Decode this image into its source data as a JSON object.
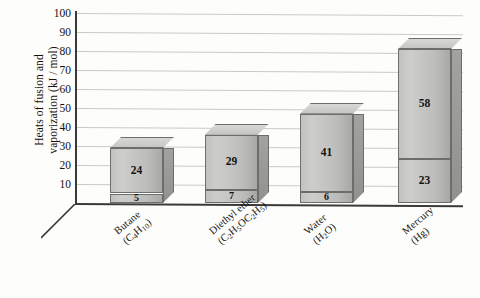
{
  "chart": {
    "type": "bar",
    "title": "",
    "xlabel": "",
    "ylabel_line1": "Heats of fusion and",
    "ylabel_line2": "vaporization (kJ / mol)",
    "ylim": [
      0,
      100
    ],
    "yticks": [
      10,
      20,
      30,
      40,
      50,
      60,
      70,
      80,
      90,
      100
    ],
    "grid": true,
    "legend": "none",
    "style": "3d-stacked-column",
    "axis_color": "#3c3a38",
    "grid_color": "#c9c9c7",
    "bar_face_color": "#c2c2c0",
    "bar_top_color": "#d8d8d6",
    "bar_side_color": "#a2a2a0",
    "background": "#fdfdfc"
  },
  "chart_data": {
    "type": "bar",
    "title": "",
    "xlabel": "",
    "ylabel": "Heats of fusion and vaporization (kJ / mol)",
    "ylim": [
      0,
      100
    ],
    "yticks": [
      10,
      20,
      30,
      40,
      50,
      60,
      70,
      80,
      90,
      100
    ],
    "grid": true,
    "legend": "none",
    "stacked": true,
    "categories": [
      "Butane (C4H10)",
      "Diethyl ether (C2H5OC2H5)",
      "Water (H2O)",
      "Mercury (Hg)"
    ],
    "series": [
      {
        "name": "Heat of fusion",
        "values": [
          5,
          7,
          6,
          23
        ]
      },
      {
        "name": "Heat of vaporization",
        "values": [
          24,
          29,
          41,
          58
        ]
      }
    ],
    "totals": [
      29,
      36,
      47,
      81
    ]
  },
  "categories": [
    {
      "name": "butane",
      "line1": "Butane",
      "line2_pre": "(C",
      "line2_sub1": "4",
      "line2_mid1": "H",
      "line2_sub2": "10",
      "line2_post": ")",
      "fusion": 5,
      "vaporization": 24
    },
    {
      "name": "diethyl-ether",
      "line1": "Diethyl ether",
      "line2_pre": "(C",
      "line2_sub1": "2",
      "line2_mid1": "H",
      "line2_sub2": "5",
      "line2_mid2": "OC",
      "line2_sub3": "2",
      "line2_mid3": "H",
      "line2_sub4": "5",
      "line2_post": ")",
      "fusion": 7,
      "vaporization": 29
    },
    {
      "name": "water",
      "line1": "Water",
      "line2_pre": "(H",
      "line2_sub1": "2",
      "line2_mid1": "O",
      "line2_post": ")",
      "fusion": 6,
      "vaporization": 41
    },
    {
      "name": "mercury",
      "line1": "Mercury",
      "line2_pre": "(Hg)",
      "fusion": 23,
      "vaporization": 58
    }
  ]
}
